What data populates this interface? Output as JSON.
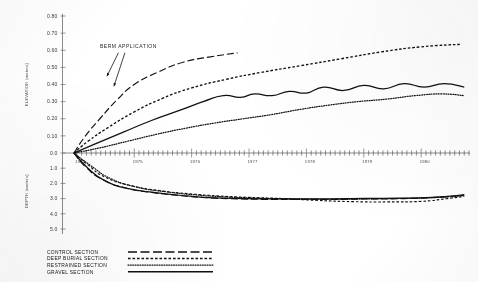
{
  "chart_data": {
    "type": "line",
    "title": "",
    "xlabel": "",
    "ylabel_upper": "ELEVATION (meters)",
    "ylabel_lower": "DEPTH (meters)",
    "xlim": [
      1973.75,
      1980.85
    ],
    "ylim_upper": [
      0.0,
      0.8
    ],
    "ylim_lower": [
      0.0,
      5.0
    ],
    "grid": false,
    "legend_position": "bottom-left",
    "x_tick_labels": [
      "1974",
      "1975",
      "1976",
      "1977",
      "1978",
      "1979",
      "1980"
    ],
    "y_tick_labels_upper": [
      "0.0",
      "0.10",
      "0.20",
      "0.30",
      "0.40",
      "0.50",
      "0.60",
      "0.70",
      "0.80"
    ],
    "y_tick_labels_lower": [
      "0.0",
      "1.0",
      "2.0",
      "3.0",
      "4.0",
      "5.0"
    ],
    "annotations": [
      {
        "text": "BERM  APPLICATION",
        "x": 1974.55,
        "y": 0.6
      }
    ],
    "series": [
      {
        "name": "CONTROL SECTION",
        "style": "long-dash",
        "panel": "upper",
        "x": [
          1973.95,
          1974.15,
          1974.4,
          1974.7,
          1975.0,
          1975.4,
          1975.85,
          1976.3,
          1976.8
        ],
        "values": [
          0.0,
          0.1,
          0.2,
          0.31,
          0.4,
          0.47,
          0.53,
          0.56,
          0.585
        ]
      },
      {
        "name": "DEEP BURIAL SECTION",
        "style": "dashed",
        "panel": "upper",
        "x": [
          1973.95,
          1974.2,
          1974.55,
          1975.0,
          1975.5,
          1976.0,
          1976.6,
          1977.2,
          1977.9,
          1978.6,
          1979.3,
          1980.0,
          1980.7
        ],
        "values": [
          0.0,
          0.07,
          0.15,
          0.24,
          0.32,
          0.38,
          0.43,
          0.47,
          0.51,
          0.55,
          0.59,
          0.62,
          0.635
        ]
      },
      {
        "name": "GRAVEL SECTION",
        "style": "solid",
        "panel": "upper",
        "x": [
          1973.95,
          1974.3,
          1974.8,
          1975.3,
          1975.8,
          1976.2,
          1976.55,
          1976.85,
          1977.1,
          1977.4,
          1977.7,
          1978.0,
          1978.3,
          1978.65,
          1979.0,
          1979.35,
          1979.7,
          1980.05,
          1980.4,
          1980.75
        ],
        "values": [
          0.0,
          0.05,
          0.12,
          0.19,
          0.25,
          0.3,
          0.335,
          0.325,
          0.345,
          0.335,
          0.36,
          0.35,
          0.385,
          0.365,
          0.395,
          0.375,
          0.405,
          0.385,
          0.405,
          0.385
        ]
      },
      {
        "name": "RESTRAINED SECTION",
        "style": "dotted",
        "panel": "upper",
        "x": [
          1973.95,
          1974.4,
          1974.9,
          1975.4,
          1975.9,
          1976.4,
          1976.9,
          1977.4,
          1977.9,
          1978.4,
          1978.9,
          1979.4,
          1979.9,
          1980.35,
          1980.75
        ],
        "values": [
          0.0,
          0.03,
          0.07,
          0.11,
          0.145,
          0.175,
          0.2,
          0.225,
          0.255,
          0.28,
          0.3,
          0.315,
          0.335,
          0.345,
          0.335
        ]
      },
      {
        "name": "CONTROL SECTION",
        "style": "long-dash",
        "panel": "lower",
        "x": [
          1973.95,
          1974.15,
          1974.45,
          1974.85,
          1975.3,
          1975.8,
          1976.3,
          1976.8,
          1977.3,
          1977.9,
          1978.5,
          1979.1,
          1979.7,
          1980.25,
          1980.75
        ],
        "values": [
          0.0,
          0.9,
          1.75,
          2.3,
          2.6,
          2.8,
          2.95,
          3.02,
          3.05,
          3.06,
          3.05,
          3.02,
          3.0,
          2.92,
          2.78
        ]
      },
      {
        "name": "DEEP BURIAL SECTION",
        "style": "dashed",
        "panel": "lower",
        "x": [
          1973.95,
          1974.2,
          1974.5,
          1974.95,
          1975.45,
          1975.95,
          1976.45,
          1977.0,
          1977.6,
          1978.2,
          1978.8,
          1979.4,
          1980.0,
          1980.45,
          1980.75
        ],
        "values": [
          0.0,
          0.8,
          1.6,
          2.15,
          2.48,
          2.68,
          2.82,
          2.92,
          3.0,
          3.12,
          3.2,
          3.22,
          3.18,
          3.0,
          2.85
        ]
      },
      {
        "name": "RESTRAINED SECTION",
        "style": "dotted",
        "panel": "lower",
        "x": [
          1973.95,
          1974.25,
          1974.6,
          1975.05,
          1975.55,
          1976.05,
          1976.55,
          1977.1,
          1977.7,
          1978.3,
          1978.9,
          1979.5,
          1980.05,
          1980.5,
          1980.75
        ],
        "values": [
          0.0,
          0.85,
          1.7,
          2.25,
          2.55,
          2.75,
          2.88,
          2.96,
          3.02,
          3.04,
          3.03,
          3.0,
          2.96,
          2.88,
          2.8
        ]
      },
      {
        "name": "GRAVEL SECTION",
        "style": "solid",
        "panel": "lower",
        "x": [
          1973.95,
          1974.18,
          1974.48,
          1974.9,
          1975.4,
          1975.9,
          1976.4,
          1976.95,
          1977.55,
          1978.15,
          1978.75,
          1979.35,
          1979.95,
          1980.45,
          1980.75
        ],
        "values": [
          0.0,
          0.95,
          1.8,
          2.35,
          2.62,
          2.82,
          2.96,
          3.0,
          3.02,
          3.02,
          3.0,
          2.98,
          2.95,
          2.86,
          2.74
        ]
      }
    ]
  },
  "axes": {
    "upper": {
      "label": "ELEVATION (meters)",
      "ticks": [
        "0.80",
        "0.70",
        "0.60",
        "0.50",
        "0.40",
        "0.30",
        "0.20",
        "0.10",
        "0.0"
      ]
    },
    "lower": {
      "label": "DEPTH (meters)",
      "ticks": [
        "0.0",
        "1.0",
        "2.0",
        "3.0",
        "4.0",
        "5.0"
      ]
    },
    "x": {
      "ticks": [
        "1974",
        "1975",
        "1976",
        "1977",
        "1978",
        "1979",
        "1980"
      ]
    }
  },
  "annotation": {
    "berm": "BERM  APPLICATION"
  },
  "legend": {
    "items": [
      {
        "label": "CONTROL SECTION",
        "style": "long-dash"
      },
      {
        "label": "DEEP BURIAL SECTION",
        "style": "dashed"
      },
      {
        "label": "RESTRAINED SECTION",
        "style": "dotted"
      },
      {
        "label": "GRAVEL SECTION",
        "style": "solid"
      }
    ]
  }
}
